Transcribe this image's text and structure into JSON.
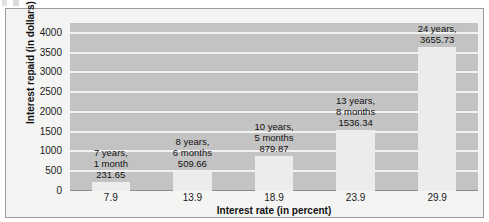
{
  "chart_data": {
    "type": "bar",
    "title": "",
    "xlabel": "Interest rate (in percent)",
    "ylabel": "Interest repaid (in dollars)",
    "categories": [
      "7.9",
      "13.9",
      "18.9",
      "23.9",
      "29.9"
    ],
    "values": [
      231.65,
      509.66,
      879.87,
      1536.34,
      3655.73
    ],
    "ylim": [
      0,
      4250
    ],
    "yticks": [
      0,
      500,
      1000,
      1500,
      2000,
      2500,
      3000,
      3500,
      4000
    ],
    "ytick_labels": [
      "0",
      "500",
      "1000",
      "1500",
      "2000",
      "2500",
      "3000",
      "3500",
      "4000"
    ],
    "grid": true,
    "legend": false,
    "bar_labels": [
      {
        "line1": "7 years,",
        "line2": "1 month",
        "line3": "231.65"
      },
      {
        "line1": "8 years,",
        "line2": "6 months",
        "line3": "509.66"
      },
      {
        "line1": "10 years,",
        "line2": "5 months",
        "line3": "879.87"
      },
      {
        "line1": "13 years,",
        "line2": "8 months",
        "line3": "1536.34"
      },
      {
        "line1": "24 years,",
        "line2": "3655.73",
        "line3": ""
      }
    ],
    "colors": {
      "plot_background": "#c3c3c3",
      "bar_fill": "#ececeb",
      "gridline": "#f2f2f1",
      "figure_background": "#f4f4f3",
      "text": "#111111"
    }
  }
}
